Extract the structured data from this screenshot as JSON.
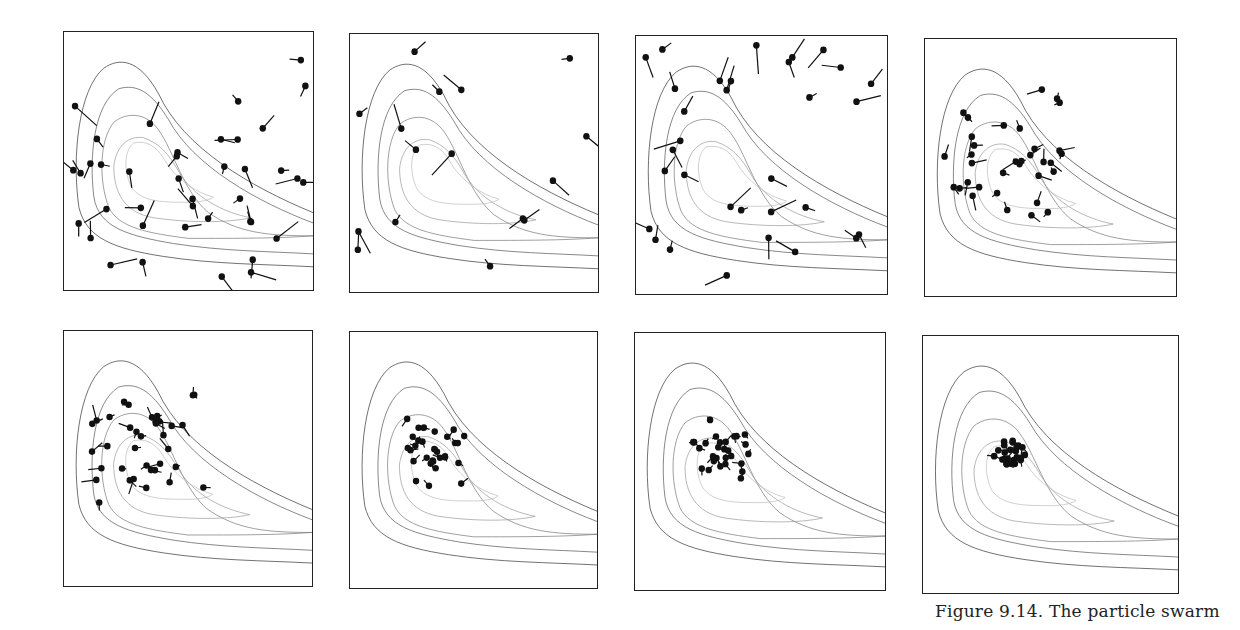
{
  "figure": {
    "caption": "Figure 9.14. The particle swarm",
    "panel_count": 8,
    "contour_colors": [
      "#333333",
      "#555555",
      "#777777",
      "#999999",
      "#bbbbbb"
    ],
    "particle_color": "#111111"
  },
  "chart_data": {
    "type": "scatter",
    "title": "Figure 9.14. The particle swarm",
    "xlabel": "",
    "ylabel": "",
    "grid": false,
    "legend": "none",
    "panels": [
      {
        "row": 1,
        "col": 1,
        "iteration_index": 1,
        "spread": "wide",
        "approx_particles": 40
      },
      {
        "row": 1,
        "col": 2,
        "iteration_index": 2,
        "spread": "wide",
        "approx_particles": 16
      },
      {
        "row": 1,
        "col": 3,
        "iteration_index": 3,
        "spread": "wide",
        "approx_particles": 32
      },
      {
        "row": 1,
        "col": 4,
        "iteration_index": 4,
        "spread": "medium",
        "approx_particles": 34
      },
      {
        "row": 2,
        "col": 1,
        "iteration_index": 5,
        "spread": "medium",
        "approx_particles": 36
      },
      {
        "row": 2,
        "col": 2,
        "iteration_index": 6,
        "spread": "narrow",
        "approx_particles": 30
      },
      {
        "row": 2,
        "col": 3,
        "iteration_index": 7,
        "spread": "narrow",
        "approx_particles": 28
      },
      {
        "row": 2,
        "col": 4,
        "iteration_index": 8,
        "spread": "converged",
        "approx_particles": 25
      }
    ]
  }
}
